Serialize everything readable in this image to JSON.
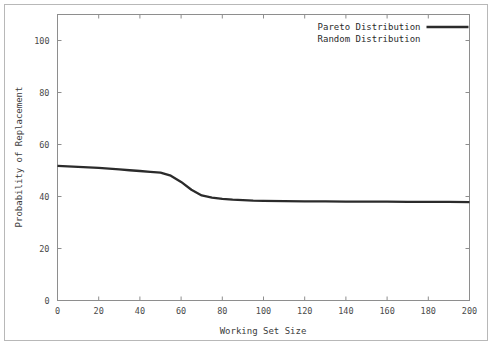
{
  "chart_data": {
    "type": "line",
    "title": "",
    "xlabel": "Working Set Size",
    "ylabel": "Probability of Replacement",
    "xlim": [
      0,
      200
    ],
    "ylim": [
      0,
      110
    ],
    "xticks": [
      0,
      20,
      40,
      60,
      80,
      100,
      120,
      140,
      160,
      180,
      200
    ],
    "yticks": [
      0,
      20,
      40,
      60,
      80,
      100
    ],
    "grid": false,
    "legend_position": "top-right",
    "series": [
      {
        "name": "Pareto Distribution",
        "color": "#2b2b2b",
        "visible": true,
        "x": [
          0,
          5,
          10,
          15,
          20,
          25,
          30,
          35,
          40,
          45,
          50,
          55,
          60,
          65,
          70,
          75,
          80,
          85,
          90,
          95,
          100,
          110,
          120,
          130,
          140,
          150,
          160,
          170,
          180,
          190,
          200
        ],
        "values": [
          51.8,
          51.6,
          51.4,
          51.2,
          51.0,
          50.7,
          50.4,
          50.1,
          49.8,
          49.5,
          49.2,
          48.0,
          45.6,
          42.6,
          40.4,
          39.6,
          39.1,
          38.8,
          38.6,
          38.4,
          38.3,
          38.2,
          38.1,
          38.1,
          38.0,
          38.0,
          38.0,
          37.9,
          37.9,
          37.9,
          37.8
        ]
      },
      {
        "name": "Random Distribution",
        "color": "#ffffff",
        "visible": false,
        "x": [],
        "values": []
      }
    ]
  },
  "legend": {
    "entries": [
      {
        "label": "Pareto Distribution",
        "has_line_sample": true
      },
      {
        "label": "Random Distribution",
        "has_line_sample": false
      }
    ]
  },
  "axes": {
    "x_tick_labels": [
      "0",
      "20",
      "40",
      "60",
      "80",
      "100",
      "120",
      "140",
      "160",
      "180",
      "200"
    ],
    "y_tick_labels": [
      "0",
      "20",
      "40",
      "60",
      "80",
      "100"
    ],
    "x_axis_title": "Working Set Size",
    "y_axis_title": "Probability of Replacement"
  }
}
